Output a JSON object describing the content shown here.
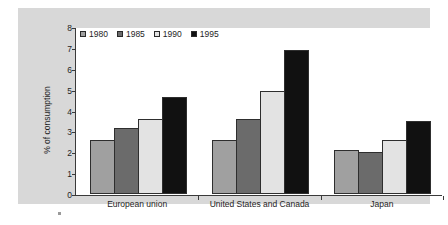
{
  "chart_data": {
    "type": "bar",
    "title": "",
    "xlabel": "",
    "ylabel": "% of consumption",
    "ylim": [
      0,
      8
    ],
    "yticks": [
      "0",
      "1",
      "2",
      "3",
      "4",
      "5",
      "6",
      "7",
      "8"
    ],
    "grid": false,
    "legend_position": "top-left",
    "categories": [
      "European union",
      "United States and Canada",
      "Japan"
    ],
    "series": [
      {
        "name": "1980",
        "color": "#a0a0a0",
        "values": [
          2.6,
          2.6,
          2.1
        ]
      },
      {
        "name": "1985",
        "color": "#6b6b6b",
        "values": [
          3.15,
          3.6,
          2.0
        ]
      },
      {
        "name": "1990",
        "color": "#e3e3e3",
        "values": [
          3.6,
          4.95,
          2.6
        ]
      },
      {
        "name": "1995",
        "color": "#111111",
        "values": [
          4.65,
          6.9,
          3.5
        ]
      }
    ]
  },
  "style": {
    "panel_background": "#d8d8d8",
    "plot_background": "#ffffff",
    "axis_color": "#3a3a3a",
    "text_color": "#1e1e1e"
  }
}
